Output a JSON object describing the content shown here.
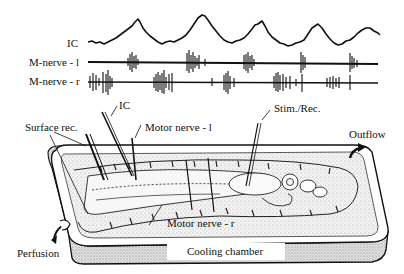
{
  "traces": {
    "ic_label": "IC",
    "m_nerve_l_label": "M-nerve - l",
    "m_nerve_r_label": "M-nerve - r"
  },
  "apparatus": {
    "ic_label": "IC",
    "surface_rec_label": "Surface rec.",
    "motor_nerve_l_label": "Motor nerve - l",
    "motor_nerve_r_label": "Motor nerve - r",
    "stim_rec_label": "Stim./Rec.",
    "outflow_label": "Outflow",
    "perfusion_label": "Perfusion",
    "cooling_chamber_label": "Cooling chamber"
  },
  "colors": {
    "ink": "#111111",
    "stipple": "#bdbdbd",
    "background": "#ffffff"
  }
}
